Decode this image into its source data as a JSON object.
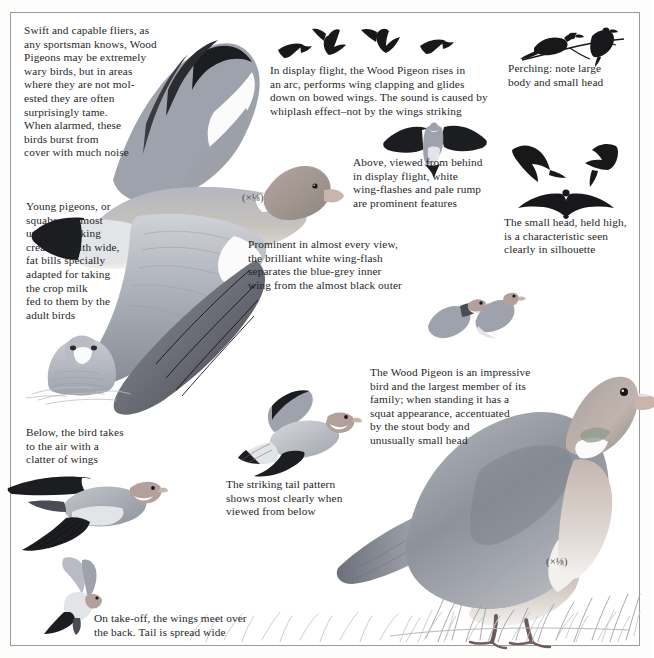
{
  "plate": {
    "subject": "Wood Pigeon",
    "page_heading_partial": "Wood Pigeon",
    "background_color": "#ffffff",
    "frame_color": "#9a9a9a",
    "ink_color": "#1f1f28"
  },
  "captions": [
    {
      "id": "swift-fliers",
      "text": "Swift and capable fliers, as\nany sportsman knows, Wood\nPigeons may be extremely\nwary birds, but in areas\nwhere they are not mol-\nested they are often\nsurprisingly tame.\nWhen alarmed, these\nbirds burst from\ncover with much noise"
    },
    {
      "id": "display-flight",
      "text": "In display flight, the Wood Pigeon rises in\nan arc, performs wing clapping and glides\ndown on bowed wings. The sound is caused by\nwhiplash effect–not by the wings striking"
    },
    {
      "id": "perching",
      "text": "Perching: note large\nbody and small head"
    },
    {
      "id": "above-behind",
      "text": "Above, viewed from behind\nin display flight, white\nwing-flashes and pale rump\nare prominent features"
    },
    {
      "id": "small-head-silhouette",
      "text": "The small head, held high,\nis a characteristic seen\nclearly in silhouette"
    },
    {
      "id": "young-squabs",
      "text": "Young pigeons, or\nsquabs, are most\nunusual-looking\ncreatures with wide,\nfat bills specially\nadapted for taking\nthe crop milk\nfed to them by the\nadult birds"
    },
    {
      "id": "wing-flash",
      "text": "Prominent in almost every view,\nthe brilliant white wing-flash\nseparates the blue-grey inner\nwing from the almost black outer"
    },
    {
      "id": "takes-to-air",
      "text": "Below, the bird takes\nto the air with a\nclatter of wings"
    },
    {
      "id": "tail-pattern",
      "text": "The striking tail pattern\nshows most clearly when\nviewed from below"
    },
    {
      "id": "impressive-bird",
      "text": "The Wood Pigeon is an impressive\nbird and the largest member of its\nfamily; when standing it has a\nsquat appearance, accentuated\nby the stout body and\nunusually small head"
    },
    {
      "id": "take-off",
      "text": "On take-off, the wings meet over\nthe back. Tail is spread wide"
    }
  ],
  "scale_marks": [
    {
      "id": "scale-flying-bird",
      "label": "(×⅛)"
    },
    {
      "id": "scale-standing-bird",
      "label": "(×⅛)"
    }
  ],
  "figures": [
    {
      "id": "flying-pigeon-main",
      "name": "wood-pigeon-in-flight-upper-view"
    },
    {
      "id": "display-flight-silhouettes",
      "name": "four-flying-silhouettes",
      "count": 4
    },
    {
      "id": "perching-silhouettes",
      "name": "two-perching-silhouettes-on-branch",
      "count": 2
    },
    {
      "id": "rear-display-flight",
      "name": "pigeon-from-behind-in-display-flight"
    },
    {
      "id": "flight-silhouettes-right",
      "name": "three-flight-silhouettes",
      "count": 3
    },
    {
      "id": "squab-nestling",
      "name": "young-pigeon-squab-in-nest"
    },
    {
      "id": "perched-pair",
      "name": "two-perched-pigeons-small"
    },
    {
      "id": "taking-off",
      "name": "pigeon-taking-to-the-air"
    },
    {
      "id": "tail-from-below",
      "name": "pigeon-viewed-from-below-tail-pattern"
    },
    {
      "id": "take-off-wings-up",
      "name": "pigeon-on-take-off-wings-meeting-over-back"
    },
    {
      "id": "standing-pigeon",
      "name": "standing-wood-pigeon-on-grass"
    }
  ]
}
